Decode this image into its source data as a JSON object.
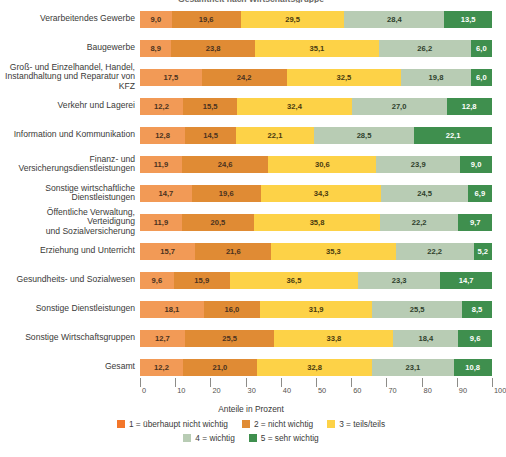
{
  "title": "Gesamtheit nach Wirtschaftsgruppe",
  "axis_title": "Anteile in Prozent",
  "legend": [
    {
      "key": "1",
      "label": "1 = überhaupt nicht wichtig",
      "color": "#f3762a"
    },
    {
      "key": "2",
      "label": "2 = nicht wichtig",
      "color": "#e08b34"
    },
    {
      "key": "3",
      "label": "3 = teils/teils",
      "color": "#fdd247"
    },
    {
      "key": "4",
      "label": "4 = wichtig",
      "color": "#b8ccb4"
    },
    {
      "key": "5",
      "label": "5 = sehr wichtig",
      "color": "#3f8f4e"
    }
  ],
  "tick_labels": [
    "0",
    "10",
    "20",
    "30",
    "40",
    "50",
    "60",
    "70",
    "80",
    "90",
    "100"
  ],
  "chart_data": {
    "type": "bar",
    "orientation": "horizontal",
    "stacked": true,
    "stack_mode": "percent",
    "title": "Gesamtheit nach Wirtschaftsgruppe",
    "xlabel": "Anteile in Prozent",
    "ylabel": "",
    "xlim": [
      0,
      100
    ],
    "xticks": [
      0,
      10,
      20,
      30,
      40,
      50,
      60,
      70,
      80,
      90,
      100
    ],
    "grid": false,
    "legend_position": "bottom",
    "categories": [
      "Verarbeitendes Gewerbe",
      "Baugewerbe",
      "Groß- und Einzelhandel, Handel, Instandhaltung und Reparatur von KFZ",
      "Verkehr und Lagerei",
      "Information und Kommunikation",
      "Finanz- und Versicherungsdienstleistungen",
      "Sonstige wirtschaftliche Dienstleistungen",
      "Öffentliche Verwaltung, Verteidigung und Sozialversicherung",
      "Erziehung und Unterricht",
      "Gesundheits- und Sozialwesen",
      "Sonstige Dienstleistungen",
      "Sonstige Wirtschaftsgruppen",
      "Gesamt"
    ],
    "series": [
      {
        "name": "1 = überhaupt nicht wichtig",
        "color": "#f29a56",
        "values": [
          9.0,
          8.9,
          17.5,
          12.2,
          12.8,
          11.9,
          14.7,
          11.9,
          15.7,
          9.6,
          18.1,
          12.7,
          12.2
        ]
      },
      {
        "name": "2 = nicht wichtig",
        "color": "#e08b34",
        "values": [
          19.6,
          23.8,
          24.2,
          15.5,
          14.5,
          24.6,
          19.6,
          20.5,
          21.6,
          15.9,
          16.0,
          25.5,
          21.0
        ]
      },
      {
        "name": "3 = teils/teils",
        "color": "#fdd247",
        "values": [
          29.5,
          35.1,
          32.5,
          32.4,
          22.1,
          30.6,
          34.3,
          35.8,
          35.3,
          36.5,
          31.9,
          33.8,
          32.8
        ]
      },
      {
        "name": "4 = wichtig",
        "color": "#b8ccb4",
        "values": [
          28.4,
          26.2,
          19.8,
          27.0,
          28.5,
          23.9,
          24.5,
          22.2,
          22.2,
          23.3,
          25.5,
          18.4,
          23.1
        ]
      },
      {
        "name": "5 = sehr wichtig",
        "color": "#3f8f4e",
        "values": [
          13.5,
          6.0,
          6.0,
          12.8,
          22.1,
          9.0,
          6.9,
          9.7,
          5.2,
          14.7,
          8.5,
          9.6,
          10.8
        ]
      }
    ]
  },
  "rows": [
    {
      "label_lines": [
        "Verarbeitendes Gewerbe"
      ],
      "values": [
        "9,0",
        "19,6",
        "29,5",
        "28,4",
        "13,5"
      ]
    },
    {
      "label_lines": [
        "Baugewerbe"
      ],
      "values": [
        "8,9",
        "23,8",
        "35,1",
        "26,2",
        "6,0"
      ]
    },
    {
      "label_lines": [
        "Groß- und Einzelhandel, Handel,",
        "Instandhaltung und Reparatur von KFZ"
      ],
      "values": [
        "17,5",
        "24,2",
        "32,5",
        "19,8",
        "6,0"
      ]
    },
    {
      "label_lines": [
        "Verkehr und Lagerei"
      ],
      "values": [
        "12,2",
        "15,5",
        "32,4",
        "27,0",
        "12,8"
      ]
    },
    {
      "label_lines": [
        "Information und Kommunikation"
      ],
      "values": [
        "12,8",
        "14,5",
        "22,1",
        "28,5",
        "22,1"
      ]
    },
    {
      "label_lines": [
        "Finanz- und",
        "Versicherungsdienstleistungen"
      ],
      "values": [
        "11,9",
        "24,6",
        "30,6",
        "23,9",
        "9,0"
      ]
    },
    {
      "label_lines": [
        "Sonstige wirtschaftliche",
        "Dienstleistungen"
      ],
      "values": [
        "14,7",
        "19,6",
        "34,3",
        "24,5",
        "6,9"
      ]
    },
    {
      "label_lines": [
        "Öffentliche Verwaltung, Verteidigung",
        "und Sozialversicherung"
      ],
      "values": [
        "11,9",
        "20,5",
        "35,8",
        "22,2",
        "9,7"
      ]
    },
    {
      "label_lines": [
        "Erziehung und Unterricht"
      ],
      "values": [
        "15,7",
        "21,6",
        "35,3",
        "22,2",
        "5,2"
      ]
    },
    {
      "label_lines": [
        "Gesundheits- und Sozialwesen"
      ],
      "values": [
        "9,6",
        "15,9",
        "36,5",
        "23,3",
        "14,7"
      ]
    },
    {
      "label_lines": [
        "Sonstige Dienstleistungen"
      ],
      "values": [
        "18,1",
        "16,0",
        "31,9",
        "25,5",
        "8,5"
      ]
    },
    {
      "label_lines": [
        "Sonstige Wirtschaftsgruppen"
      ],
      "values": [
        "12,7",
        "25,5",
        "33,8",
        "18,4",
        "9,6"
      ]
    },
    {
      "label_lines": [
        "Gesamt"
      ],
      "values": [
        "12,2",
        "21,0",
        "32,8",
        "23,1",
        "10,8"
      ]
    }
  ]
}
